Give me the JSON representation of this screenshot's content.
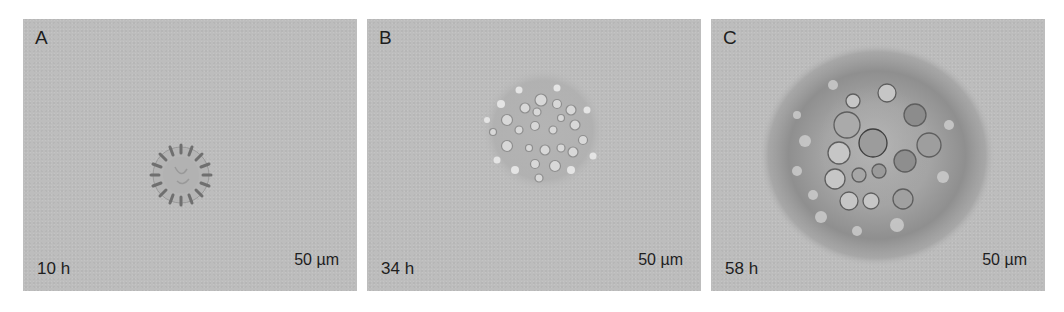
{
  "figure": {
    "panels": [
      {
        "letter": "A",
        "time": "10 h",
        "scale": "50 µm"
      },
      {
        "letter": "B",
        "time": "34 h",
        "scale": "50 µm"
      },
      {
        "letter": "C",
        "time": "58 h",
        "scale": "50 µm"
      }
    ],
    "colors": {
      "background": "#bdbdbd",
      "text": "#1e1e1e"
    }
  }
}
